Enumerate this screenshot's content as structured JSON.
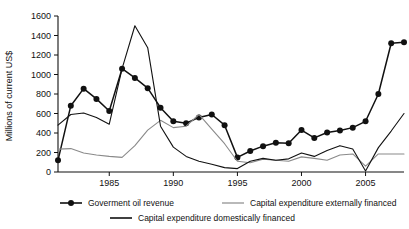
{
  "chart_data": {
    "type": "line",
    "title": "",
    "xlabel": "",
    "ylabel": "Millions of current US$",
    "ylim": [
      0,
      1600
    ],
    "xlim": [
      1981,
      2008
    ],
    "yticks": [
      0,
      200,
      400,
      600,
      800,
      1000,
      1200,
      1400,
      1600
    ],
    "ytick_labels": [
      "0",
      "200",
      "400",
      "600",
      "800",
      "1000",
      "1200",
      "1400",
      "1600"
    ],
    "xticks": [
      1985,
      1990,
      1995,
      2000,
      2005
    ],
    "xtick_labels": [
      "1985",
      "1990",
      "1995",
      "2000",
      "2005"
    ],
    "grid": false,
    "legend_position": "below",
    "x": [
      1981,
      1982,
      1983,
      1984,
      1985,
      1986,
      1987,
      1988,
      1989,
      1990,
      1991,
      1992,
      1993,
      1994,
      1995,
      1996,
      1997,
      1998,
      1999,
      2000,
      2001,
      2002,
      2003,
      2004,
      2005,
      2006,
      2007,
      2008
    ],
    "series": [
      {
        "name": "Goverment oil revenue",
        "color": "#111111",
        "style": "line-markers",
        "values": [
          120,
          680,
          855,
          750,
          625,
          1060,
          965,
          860,
          660,
          520,
          500,
          560,
          590,
          480,
          150,
          215,
          265,
          300,
          295,
          430,
          350,
          405,
          425,
          455,
          520,
          800,
          1320,
          1330
        ]
      },
      {
        "name": "Capital expenditure externally financed",
        "color": "#8a8a8a",
        "style": "line",
        "values": [
          235,
          240,
          195,
          175,
          160,
          150,
          270,
          430,
          530,
          455,
          470,
          590,
          440,
          290,
          110,
          95,
          130,
          120,
          110,
          155,
          140,
          120,
          175,
          185,
          60,
          185,
          185,
          185
        ]
      },
      {
        "name": "Capital expenditure domestically financed",
        "color": "#111111",
        "style": "line",
        "values": [
          480,
          590,
          605,
          560,
          490,
          1060,
          1500,
          1275,
          470,
          255,
          160,
          110,
          80,
          45,
          35,
          110,
          140,
          120,
          135,
          195,
          160,
          220,
          270,
          235,
          10,
          250,
          420,
          600
        ]
      }
    ]
  },
  "legend": {
    "items": [
      {
        "label": "Goverment oil revenue",
        "marker": "line-with-dot-marker"
      },
      {
        "label": "Capital expenditure externally financed",
        "marker": "gray-line"
      },
      {
        "label": "Capital expenditure domestically financed",
        "marker": "black-line"
      }
    ]
  }
}
